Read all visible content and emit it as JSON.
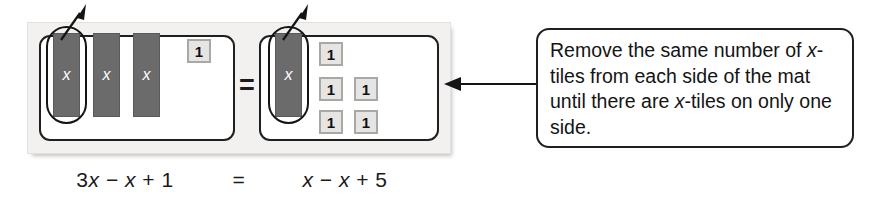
{
  "diagram": {
    "type": "algebra-tiles-equation-mat",
    "mat": {
      "equals_symbol": "=",
      "left_side": {
        "x_tiles": [
          {
            "label": "x"
          },
          {
            "label": "x"
          },
          {
            "label": "x"
          }
        ],
        "unit_tiles": [
          {
            "label": "1"
          }
        ],
        "circled_tile_index": 0
      },
      "right_side": {
        "x_tiles": [
          {
            "label": "x"
          }
        ],
        "unit_tiles": [
          {
            "label": "1"
          },
          {
            "label": "1"
          },
          {
            "label": "1"
          },
          {
            "label": "1"
          },
          {
            "label": "1"
          }
        ],
        "circled_tile_index": 0
      }
    },
    "equation": {
      "left": "3x − x + 1",
      "equals": "=",
      "right": "x − x + 5"
    },
    "callout": {
      "text_parts": [
        {
          "text": "Remove the same number of ",
          "italic": false
        },
        {
          "text": "x",
          "italic": true
        },
        {
          "text": "-tiles from each side of the mat until there are ",
          "italic": false
        },
        {
          "text": "x",
          "italic": true
        },
        {
          "text": "-tiles on only one side.",
          "italic": false
        }
      ],
      "plain_text": "Remove the same number of x-tiles from each side of the mat until there are x-tiles on only one side."
    },
    "colors": {
      "x_tile_fill": "#6b6b6b",
      "x_tile_label": "#ffffff",
      "unit_tile_fill": "#e6e5e3",
      "unit_tile_border": "#a9a8a5",
      "mat_board_bg": "#f2f1ef",
      "mat_panel_bg": "#ffffff",
      "outline": "#1f1f1f",
      "text": "#141414"
    },
    "annotations": {
      "remove_arrow_count": 2,
      "remove_arrow_direction": "up-right",
      "callout_arrow_direction": "left"
    }
  }
}
